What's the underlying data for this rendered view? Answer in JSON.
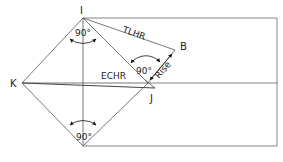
{
  "diagram": {
    "points": {
      "I": "I",
      "K": "K",
      "B": "B",
      "J": "J"
    },
    "edges": {
      "tlhr": "TLHR",
      "echr": "ECHR",
      "rise": "Rise"
    },
    "angles": {
      "top": "90°",
      "mid": "90°",
      "bottom": "90°"
    },
    "colors": {
      "line": "#555555",
      "text": "#222222"
    }
  }
}
